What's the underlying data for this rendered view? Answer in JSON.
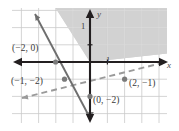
{
  "figure": {
    "name": "system-of-linear-inequalities-graph",
    "type": "coordinate-plane"
  },
  "axes": {
    "x_label": "x",
    "y_label": "y",
    "x_unit_tick_label": "1",
    "y_unit_tick_label": "1",
    "origin_px": {
      "x": 90,
      "y": 62
    },
    "unit_px": 17.2,
    "x_range": [
      -5.1,
      5.2
    ],
    "y_range": [
      -4.0,
      3.6
    ]
  },
  "colors": {
    "shade_fill": "#d2d2d2",
    "grid_line": "#c9c9c9",
    "grid_line_on_shade": "#e0e0e0",
    "axis": "#231f20",
    "solid_line": "#6e6e6e",
    "dashed_line": "#9a9a9a",
    "point_marker": "#7a7a7a",
    "label_text": "#3a3a3a",
    "background": "#ffffff"
  },
  "lines": [
    {
      "id": "solid-boundary-line",
      "style": "solid",
      "description": "steep negative slope boundary line, drawn solid",
      "slope": -4,
      "y_intercept": -8,
      "passes_through": [
        [
          -2,
          0
        ],
        [
          -1.5,
          -2
        ],
        [
          -0.6,
          -5.6
        ]
      ],
      "arrow_ends": "both"
    },
    {
      "id": "dashed-boundary-line",
      "style": "dashed",
      "description": "shallow positive slope boundary line, drawn dashed",
      "slope": 0.5,
      "y_intercept": -2,
      "passes_through": [
        [
          0,
          -2
        ],
        [
          2,
          -1
        ],
        [
          -4,
          -4
        ]
      ],
      "arrow_ends": "both"
    }
  ],
  "shaded_region": {
    "description": "region above the solid line and above the dashed line",
    "fill": "#d2d2d2"
  },
  "points": [
    {
      "id": "pt-a",
      "label": "(−2, 0)",
      "x": -2,
      "y": 0,
      "marked": true
    },
    {
      "id": "pt-b",
      "label": "(−1, −2)",
      "x": -1.5,
      "y": -2,
      "marked": true
    },
    {
      "id": "pt-c",
      "label": "(0, −2)",
      "x": 0,
      "y": -2,
      "marked": true
    },
    {
      "id": "pt-d",
      "label": "(2, −1)",
      "x": 2,
      "y": -1,
      "marked": true
    }
  ]
}
